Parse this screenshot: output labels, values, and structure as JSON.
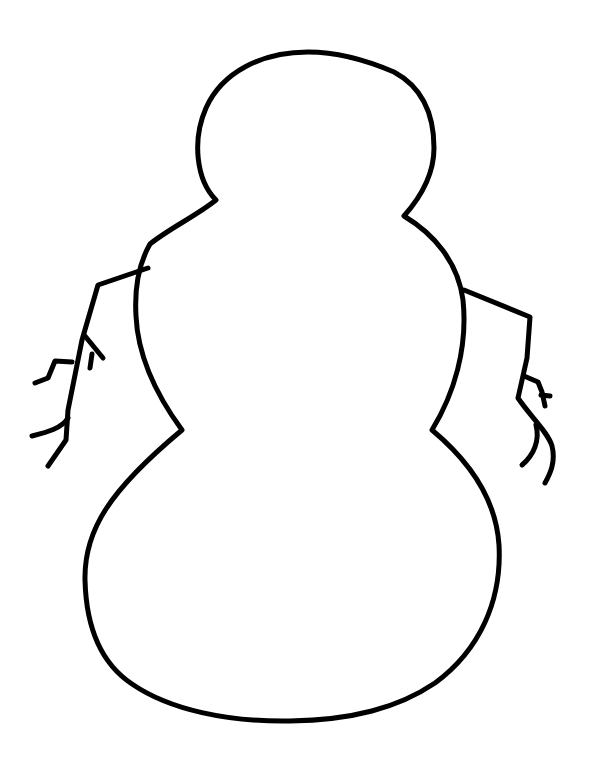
{
  "drawing": {
    "subject": "Snowman outline",
    "style": "black line art on white background",
    "colors": {
      "background": "#ffffff",
      "stroke": "#000000"
    },
    "parts": [
      {
        "name": "head",
        "shape": "circle"
      },
      {
        "name": "middle-body",
        "shape": "rounded"
      },
      {
        "name": "bottom-body",
        "shape": "large rounded"
      },
      {
        "name": "left-arm",
        "shape": "twig branch"
      },
      {
        "name": "right-arm",
        "shape": "twig branch"
      }
    ]
  }
}
